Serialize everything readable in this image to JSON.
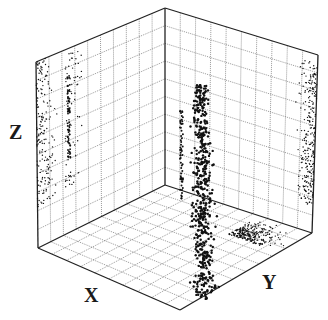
{
  "chart_data": {
    "type": "scatter",
    "subtype": "3d-scatter-with-wall-projections",
    "title": "",
    "xlabel": "X",
    "ylabel": "Y",
    "zlabel": "Z",
    "tick_labels": "none shown",
    "grid": true,
    "grid_divisions": 10,
    "legend": "none",
    "colors": {
      "points": "#111111",
      "grid": "#444444",
      "frame": "#222222",
      "background": "#ffffff"
    }
  },
  "labels": {
    "x": "X",
    "y": "Y",
    "z": "Z"
  }
}
